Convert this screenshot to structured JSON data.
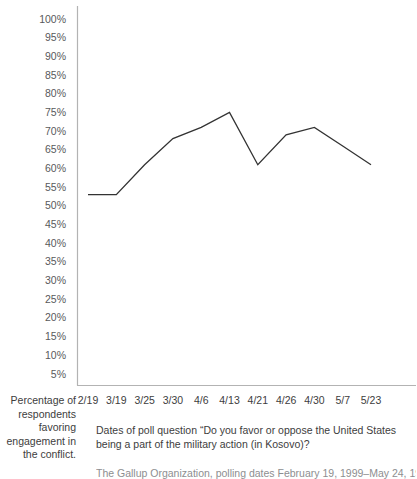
{
  "chart_data": {
    "type": "line",
    "title": "",
    "xlabel": "Dates of poll question “Do you favor or oppose the United States being a part of the military action (in Kosovo)?",
    "ylabel": "Percentage of respondents favoring engagement in the conflict.",
    "categories": [
      "2/19",
      "3/19",
      "3/25",
      "3/30",
      "4/6",
      "4/13",
      "4/21",
      "4/26",
      "4/30",
      "5/7",
      "5/23"
    ],
    "values": [
      53,
      53,
      61,
      68,
      71,
      75,
      61,
      69,
      71,
      66,
      61
    ],
    "series": [
      {
        "name": "Favor U.S. involvement",
        "values": [
          53,
          53,
          61,
          68,
          71,
          75,
          61,
          69,
          71,
          66,
          61
        ]
      }
    ],
    "ylim": [
      5,
      100
    ],
    "ytick_step": 5,
    "ytick_labels": [
      "100%",
      "95%",
      "90%",
      "85%",
      "80%",
      "75%",
      "70%",
      "65%",
      "60%",
      "55%",
      "50%",
      "45%",
      "40%",
      "35%",
      "30%",
      "25%",
      "20%",
      "15%",
      "10%",
      "5%"
    ],
    "ytick_values": [
      100,
      95,
      90,
      85,
      80,
      75,
      70,
      65,
      60,
      55,
      50,
      45,
      40,
      35,
      30,
      25,
      20,
      15,
      10,
      5
    ],
    "grid": false,
    "legend": "none",
    "line_color": "#333333",
    "axis_color": "#b3b3b3"
  },
  "captions": {
    "y_axis_caption": "Percentage of respondents favoring engagement in the conflict.",
    "question_caption": "Dates of poll question “Do you favor or oppose the United States being a part of the military action (in Kosovo)?",
    "source_note": "The Gallup Organization, polling dates February 19, 1999–May 24, 1999"
  }
}
